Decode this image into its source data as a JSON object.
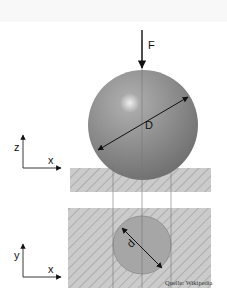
{
  "figure": {
    "labels": {
      "force": "F",
      "ball_diameter": "D",
      "indent_diameter": "d",
      "axis_z": "z",
      "axis_x_top": "x",
      "axis_y": "y",
      "axis_x_bottom": "x"
    },
    "credit": "Quelle: Wikipedia",
    "colors": {
      "sphere": "#8a8a8a",
      "sphere_highlight": "#e6e6e6",
      "hatch_bg": "#c9c9c9",
      "hatch_line": "#a9a9a9",
      "indent": "#a4a4a4",
      "line": "#111111"
    }
  }
}
